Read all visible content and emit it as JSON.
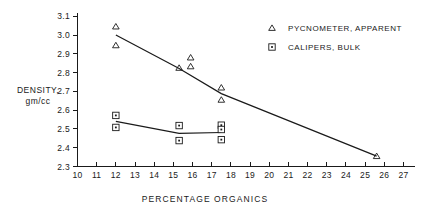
{
  "chart_data": {
    "type": "scatter",
    "title": "",
    "xlabel": "PERCENTAGE   ORGANICS",
    "ylabel_line1": "DENSITY,",
    "ylabel_line2": "gm/cc",
    "xlim": [
      10,
      27.6
    ],
    "ylim": [
      2.3,
      3.12
    ],
    "grid": false,
    "legend_position": "top-right",
    "xticks": [
      10,
      11,
      12,
      13,
      14,
      15,
      16,
      17,
      18,
      19,
      20,
      21,
      22,
      23,
      24,
      25,
      26,
      27
    ],
    "xticklabels": [
      "10",
      "11",
      "12",
      "13",
      "14",
      "15",
      "16",
      "17",
      "18",
      "19",
      "20",
      "21",
      "22",
      "23",
      "24",
      "25",
      "26",
      "27"
    ],
    "yticks": [
      2.3,
      2.4,
      2.5,
      2.6,
      2.7,
      2.8,
      2.9,
      3.0,
      3.1
    ],
    "yticklabels": [
      "2.3",
      "2.4",
      "2.5",
      "2.6",
      "2.7",
      "2.8",
      "2.9",
      "3.0",
      "3.1"
    ],
    "series": [
      {
        "name": "PYCNOMETER, APPARENT",
        "marker": "triangle",
        "points": [
          {
            "x": 12.0,
            "y": 3.045
          },
          {
            "x": 12.0,
            "y": 2.945
          },
          {
            "x": 15.3,
            "y": 2.825
          },
          {
            "x": 15.9,
            "y": 2.88
          },
          {
            "x": 15.9,
            "y": 2.833
          },
          {
            "x": 17.5,
            "y": 2.72
          },
          {
            "x": 17.5,
            "y": 2.655
          },
          {
            "x": 25.6,
            "y": 2.355
          }
        ],
        "trend": [
          {
            "x": 12.0,
            "y": 3.0
          },
          {
            "x": 15.3,
            "y": 2.822
          },
          {
            "x": 17.5,
            "y": 2.688
          },
          {
            "x": 25.6,
            "y": 2.355
          }
        ]
      },
      {
        "name": "CALIPERS, BULK",
        "marker": "square",
        "points": [
          {
            "x": 12.0,
            "y": 2.572
          },
          {
            "x": 12.0,
            "y": 2.508
          },
          {
            "x": 15.3,
            "y": 2.518
          },
          {
            "x": 15.3,
            "y": 2.438
          },
          {
            "x": 17.5,
            "y": 2.52
          },
          {
            "x": 17.5,
            "y": 2.497
          },
          {
            "x": 17.5,
            "y": 2.443
          }
        ],
        "trend": [
          {
            "x": 12.0,
            "y": 2.54
          },
          {
            "x": 15.3,
            "y": 2.476
          },
          {
            "x": 17.5,
            "y": 2.481
          }
        ]
      }
    ],
    "legend": [
      {
        "label": "PYCNOMETER, APPARENT",
        "marker": "triangle"
      },
      {
        "label": "CALIPERS, BULK",
        "marker": "square"
      }
    ]
  }
}
